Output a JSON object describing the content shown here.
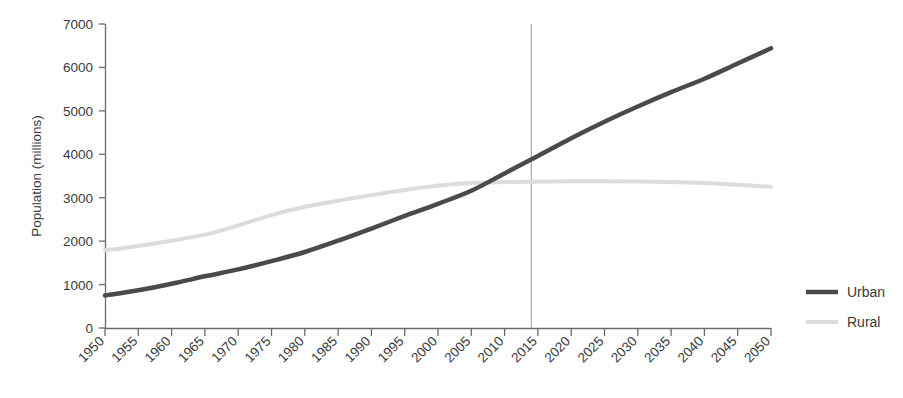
{
  "chart_data": {
    "type": "line",
    "title": "",
    "xlabel": "",
    "ylabel": "Population (millions)",
    "xlim": [
      1950,
      2050
    ],
    "ylim": [
      0,
      7000
    ],
    "grid": false,
    "legend_position": "right",
    "x": [
      1950,
      1955,
      1960,
      1965,
      1970,
      1975,
      1980,
      1985,
      1990,
      1995,
      2000,
      2005,
      2010,
      2015,
      2020,
      2025,
      2030,
      2035,
      2040,
      2045,
      2050
    ],
    "xticklabels": [
      "1950",
      "1955",
      "1960",
      "1965",
      "1970",
      "1975",
      "1980",
      "1985",
      "1990",
      "1995",
      "2000",
      "2005",
      "2010",
      "2015",
      "2020",
      "2025",
      "2030",
      "2035",
      "2040",
      "2045",
      "2050"
    ],
    "yticks": [
      0,
      1000,
      2000,
      3000,
      4000,
      5000,
      6000,
      7000
    ],
    "yticklabels": [
      "0",
      "1000",
      "2000",
      "3000",
      "4000",
      "5000",
      "6000",
      "7000"
    ],
    "series": [
      {
        "name": "Urban",
        "color": "#4a4a4a",
        "linewidth": 4.5,
        "values": [
          750,
          870,
          1020,
          1190,
          1350,
          1540,
          1750,
          2010,
          2290,
          2580,
          2860,
          3160,
          3560,
          3960,
          4370,
          4750,
          5100,
          5430,
          5740,
          6090,
          6440
        ]
      },
      {
        "name": "Rural",
        "color": "#dcdcdc",
        "linewidth": 4.0,
        "values": [
          1790,
          1890,
          2010,
          2150,
          2360,
          2600,
          2790,
          2930,
          3060,
          3180,
          3280,
          3340,
          3360,
          3370,
          3380,
          3380,
          3375,
          3360,
          3340,
          3300,
          3250
        ]
      }
    ],
    "annotations": [
      {
        "type": "vertical-line",
        "name": "present-year-marker",
        "x": 2014,
        "color": "#9a9a9a",
        "y_top": 7000,
        "y_bottom": 0
      }
    ]
  },
  "legend": {
    "items": [
      {
        "label": "Urban",
        "color": "#4a4a4a"
      },
      {
        "label": "Rural",
        "color": "#dcdcdc"
      }
    ]
  },
  "axes": {
    "y_title": "Population (millions)",
    "axis_color": "#6b6b6b"
  }
}
